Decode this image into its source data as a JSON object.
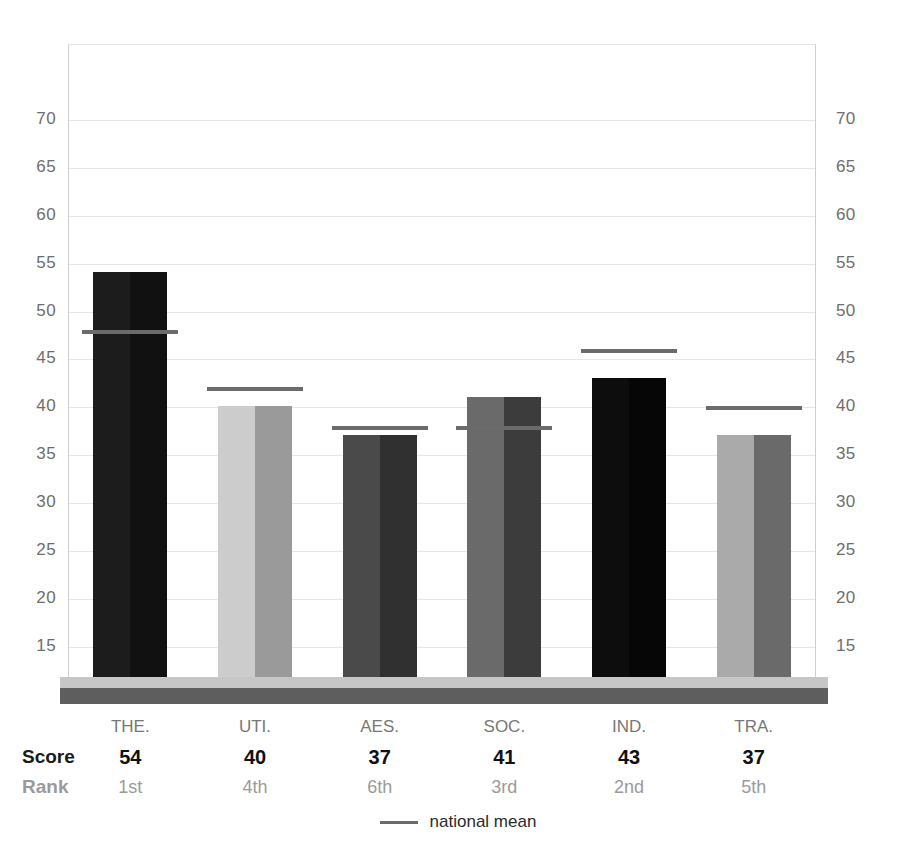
{
  "chart_data": {
    "type": "bar",
    "title": "",
    "subtitle": "",
    "xlabel": "",
    "ylabel": "",
    "ylim": [
      10,
      72
    ],
    "grid": true,
    "gridline_step": 5,
    "legend_position": "bottom-center",
    "categories": [
      "THE.",
      "UTI.",
      "AES.",
      "SOC.",
      "IND.",
      "TRA."
    ],
    "values": [
      54,
      40,
      37,
      41,
      43,
      37
    ],
    "series": [
      {
        "name": "score",
        "values": [
          54,
          40,
          37,
          41,
          43,
          37
        ]
      },
      {
        "name": "national mean",
        "values": [
          48,
          42,
          38,
          38,
          46,
          40
        ]
      }
    ],
    "ranks": [
      "1st",
      "4th",
      "6th",
      "3rd",
      "2nd",
      "5th"
    ],
    "bar_colors_left": [
      "#1c1c1c",
      "#cccccc",
      "#4a4a4a",
      "#6a6a6a",
      "#0d0d0d",
      "#aaaaaa"
    ],
    "bar_colors_right": [
      "#111111",
      "#9a9a9a",
      "#303030",
      "#3c3c3c",
      "#060606",
      "#6a6a6a"
    ],
    "yticks": [
      70,
      65,
      60,
      55,
      50,
      45,
      40,
      35,
      30,
      25,
      20,
      15
    ],
    "ytick_labels_left": [
      "70",
      "65",
      "60",
      "55",
      "50",
      "45",
      "40",
      "35",
      "30",
      "25",
      "20",
      "15"
    ],
    "ytick_labels_right": [
      "70",
      "65",
      "60",
      "55",
      "50",
      "45",
      "40",
      "35",
      "30",
      "25",
      "20",
      "15"
    ]
  },
  "table": {
    "score_row_label": "Score",
    "rank_row_label": "Rank",
    "categories": [
      "THE.",
      "UTI.",
      "AES.",
      "SOC.",
      "IND.",
      "TRA."
    ],
    "scores": [
      "54",
      "40",
      "37",
      "41",
      "43",
      "37"
    ],
    "ranks": [
      "1st",
      "4th",
      "6th",
      "3rd",
      "2nd",
      "5th"
    ]
  },
  "legend": {
    "mean_label": "national mean",
    "mean_color": "#6b6b6b"
  },
  "colors": {
    "gridline": "#e6e6e6",
    "axis": "#cfcfcf",
    "plinth_top": "#c6c6c6",
    "plinth_face": "#5e5e5e",
    "tick_text": "#6e6e6e"
  }
}
